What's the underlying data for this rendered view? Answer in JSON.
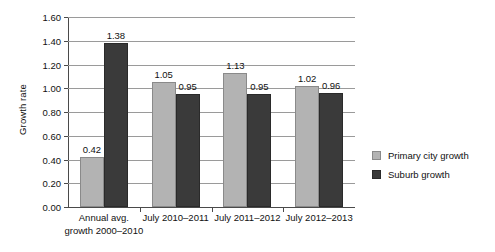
{
  "chart_data": {
    "type": "bar",
    "title": "",
    "xlabel": "",
    "ylabel": "Growth rate",
    "ylim": [
      0.0,
      1.6
    ],
    "ytick_step": 0.2,
    "ytick_labels": [
      "0.00",
      "0.20",
      "0.40",
      "0.60",
      "0.80",
      "1.00",
      "1.20",
      "1.40",
      "1.60"
    ],
    "grid": true,
    "legend_position": "right",
    "categories": [
      "Annual avg.\ngrowth 2000–2010",
      "July 2010–2011",
      "July 2011–2012",
      "July 2012–2013"
    ],
    "category_labels": [
      {
        "line1": "Annual avg.",
        "line2": "growth 2000–2010"
      },
      {
        "line1": "July 2010–2011",
        "line2": ""
      },
      {
        "line1": "July 2011–2012",
        "line2": ""
      },
      {
        "line1": "July 2012–2013",
        "line2": ""
      }
    ],
    "series": [
      {
        "name": "Primary city growth",
        "color": "#b3b3b3",
        "values": [
          0.42,
          1.05,
          1.13,
          1.02
        ],
        "value_labels": [
          "0.42",
          "1.05",
          "1.13",
          "1.02"
        ]
      },
      {
        "name": "Suburb growth",
        "color": "#3a3a3a",
        "values": [
          1.38,
          0.95,
          0.95,
          0.96
        ],
        "value_labels": [
          "1.38",
          "0.95",
          "0.95",
          "0.96"
        ]
      }
    ]
  },
  "legend": {
    "items": [
      {
        "label": "Primary city growth",
        "swatch": "primary"
      },
      {
        "label": "Suburb growth",
        "swatch": "suburb"
      }
    ]
  }
}
